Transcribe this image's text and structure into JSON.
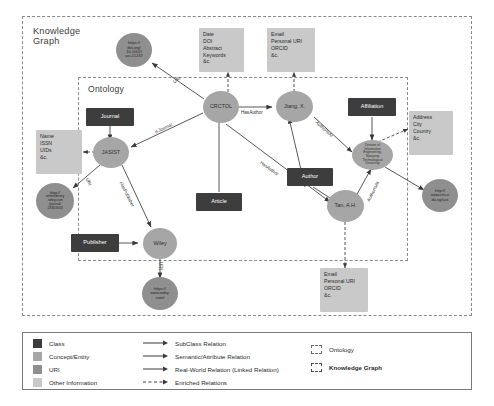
{
  "figure": {
    "kg_boundary_label": "Knowledge\nGraph",
    "ontology_boundary_label": "Ontology"
  },
  "nodes": {
    "classes": [
      {
        "id": "journal",
        "label": "Journal"
      },
      {
        "id": "publisher",
        "label": "Publisher"
      },
      {
        "id": "article",
        "label": "Article"
      },
      {
        "id": "author",
        "label": "Author"
      },
      {
        "id": "affiliation",
        "label": "Affiliation"
      }
    ],
    "entities": [
      {
        "id": "crctol",
        "label": "CRCTOL"
      },
      {
        "id": "jasist",
        "label": "JASIST"
      },
      {
        "id": "wiley",
        "label": "Wiley"
      },
      {
        "id": "jiang",
        "label": "Jiang, X."
      },
      {
        "id": "tan",
        "label": "Tan, A.H."
      },
      {
        "id": "ntu",
        "label": "Division of\nInformation\nEngineering,\nNanyang\nTechnological\nUniversity"
      }
    ],
    "uris": [
      {
        "id": "doi-uri",
        "label": "https://\ndoi.org/\n10.1002/\nasi.21237"
      },
      {
        "id": "jasist-uri",
        "label": "https://\nonlinelibrary\n.wiley.com\n/journal/\n23301643"
      },
      {
        "id": "wiley-uri",
        "label": "https://\nwww.wiley.\ncom/"
      },
      {
        "id": "ntu-uri",
        "label": "http://\nwww.ntu.e\ndu.sg/sce"
      }
    ],
    "info_boxes": [
      {
        "id": "article-info",
        "label": "Date\nDOI\nAbstract\nKeywords\n&c."
      },
      {
        "id": "jiang-info",
        "label": "Email\nPersonal URI\nORCID\n&c."
      },
      {
        "id": "journal-info",
        "label": "Name\nISSN\nUIDs\n&c."
      },
      {
        "id": "affiliation-info",
        "label": "Address\nCity\nCountry\n&c."
      },
      {
        "id": "tan-info",
        "label": "Email\nPersonal URI\nORCID\n&c."
      }
    ]
  },
  "edges": [
    {
      "id": "e-doi-uri",
      "label": "URI"
    },
    {
      "id": "e-hasauthor-jiang",
      "label": "HasAuthor"
    },
    {
      "id": "e-isjournal",
      "label": "IsJournal"
    },
    {
      "id": "e-haspublisher",
      "label": "HasPublisher"
    },
    {
      "id": "e-hasauthor-tan",
      "label": "HasAuthor"
    },
    {
      "id": "e-authorisat-jiang",
      "label": "AuthorIsAt"
    },
    {
      "id": "e-authorisat-tan",
      "label": "AuthorIsAt"
    },
    {
      "id": "e-jasist-uri",
      "label": "URI"
    },
    {
      "id": "e-wiley-uri",
      "label": "URI"
    }
  ],
  "legend": {
    "node_types": [
      {
        "label": "Class",
        "color": "#3d3d3d"
      },
      {
        "label": "Concept/Entity",
        "color": "#a6a6a6"
      },
      {
        "label": "URI",
        "color": "#8f8f8f"
      },
      {
        "label": "Other Information",
        "color": "#c9c9c9"
      }
    ],
    "relations": [
      {
        "label": "SubClass Relation",
        "style": "solid"
      },
      {
        "label": "Semantic/Attribute Relation",
        "style": "solid"
      },
      {
        "label": "Real-World Relation (Linked Relation)",
        "style": "solid"
      },
      {
        "label": "Enriched Relations",
        "style": "dashed"
      }
    ],
    "boundaries": [
      {
        "label": "Ontology",
        "style": "fine-dashed"
      },
      {
        "label": "Knowledge Graph",
        "style": "bold-dashed"
      }
    ]
  }
}
